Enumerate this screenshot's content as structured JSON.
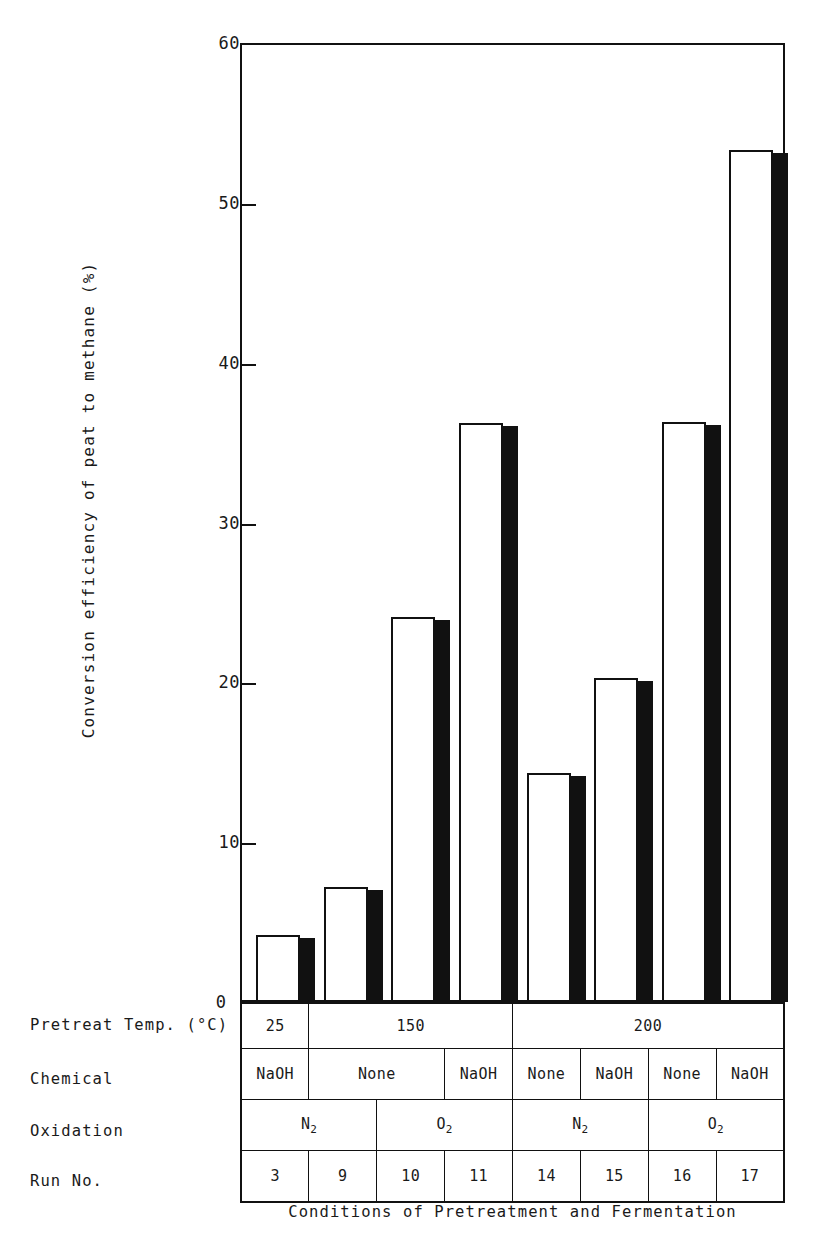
{
  "chart_data": {
    "type": "bar",
    "title": "",
    "xlabel": "Conditions of Pretreatment and Fermentation",
    "ylabel": "Conversion efficiency of peat to methane (%)",
    "ylim": [
      0,
      60
    ],
    "yticks": [
      0,
      10,
      20,
      30,
      40,
      50,
      60
    ],
    "ytick_labels": [
      "0",
      "10",
      "20",
      "30",
      "40",
      "50",
      "60"
    ],
    "grid": false,
    "legend": "none",
    "categories": [
      "3",
      "9",
      "10",
      "11",
      "14",
      "15",
      "16",
      "17"
    ],
    "values": [
      4.2,
      7.2,
      24.1,
      36.2,
      14.3,
      20.3,
      36.3,
      53.3
    ],
    "bar_style": "3d-white-face-black-side",
    "conditions": {
      "row_labels": [
        "Pretreat Temp. (°C)",
        "Chemical",
        "Oxidation",
        "Run No."
      ],
      "pretreat_temp": [
        {
          "label": "25",
          "span": 1
        },
        {
          "label": "150",
          "span": 3
        },
        {
          "label": "200",
          "span": 4
        }
      ],
      "chemical": [
        {
          "label": "NaOH",
          "span": 1
        },
        {
          "label": "None",
          "span": 2
        },
        {
          "label": "NaOH",
          "span": 1
        },
        {
          "label": "None",
          "span": 1
        },
        {
          "label": "NaOH",
          "span": 1
        },
        {
          "label": "None",
          "span": 1
        },
        {
          "label": "NaOH",
          "span": 1
        }
      ],
      "oxidation": [
        {
          "label": "N2",
          "base": "N",
          "sub": "2",
          "span": 2
        },
        {
          "label": "O2",
          "base": "O",
          "sub": "2",
          "span": 2
        },
        {
          "label": "N2",
          "base": "N",
          "sub": "2",
          "span": 2
        },
        {
          "label": "O2",
          "base": "O",
          "sub": "2",
          "span": 2
        }
      ],
      "run_no": [
        "3",
        "9",
        "10",
        "11",
        "14",
        "15",
        "16",
        "17"
      ]
    }
  },
  "axis": {
    "y_title": "Conversion efficiency of peat to methane (%)",
    "tick_60": "60",
    "tick_50": "50",
    "tick_40": "40",
    "tick_30": "30",
    "tick_20": "20",
    "tick_10": "10",
    "tick_0": "0"
  },
  "caption": {
    "text": "Conditions of Pretreatment and Fermentation"
  },
  "colors": {
    "ink": "#111111",
    "paper": "#ffffff",
    "bar_face": "#ffffff",
    "bar_side": "#111111"
  }
}
